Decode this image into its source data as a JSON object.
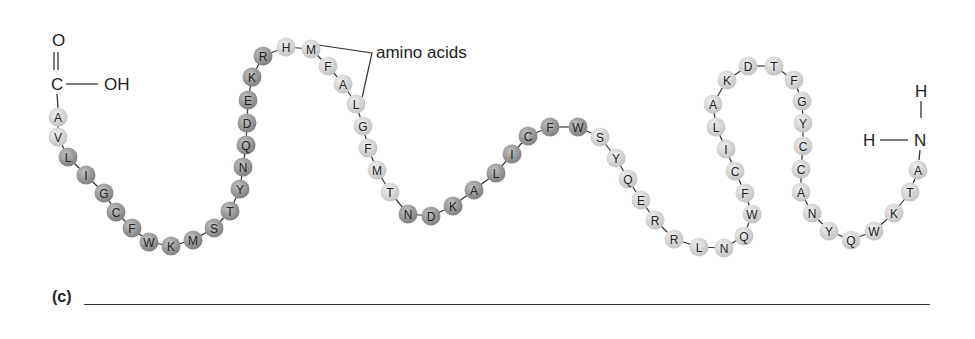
{
  "carboxyl_group": {
    "O": "O",
    "C": "C",
    "OH": "OH",
    "name": "carboxyl-terminus"
  },
  "amino_group": {
    "H_top": "H",
    "H_left": "H",
    "N": "N",
    "name": "amino-terminus"
  },
  "callout": {
    "label": "amino acids"
  },
  "question": {
    "label": "(c)",
    "answer_line": ""
  },
  "colors": {
    "light_residue": "#d6d6d6",
    "dark_residue": "#9a9a9a",
    "bond": "#333333"
  },
  "residues": [
    {
      "aa": "A",
      "x": 58,
      "y": 117,
      "shade": "light"
    },
    {
      "aa": "V",
      "x": 58,
      "y": 137,
      "shade": "light"
    },
    {
      "aa": "L",
      "x": 68,
      "y": 157,
      "shade": "dark"
    },
    {
      "aa": "I",
      "x": 86,
      "y": 175,
      "shade": "dark"
    },
    {
      "aa": "G",
      "x": 104,
      "y": 193,
      "shade": "dark"
    },
    {
      "aa": "C",
      "x": 116,
      "y": 212,
      "shade": "dark"
    },
    {
      "aa": "F",
      "x": 132,
      "y": 228,
      "shade": "dark"
    },
    {
      "aa": "W",
      "x": 149,
      "y": 242,
      "shade": "dark"
    },
    {
      "aa": "K",
      "x": 171,
      "y": 246,
      "shade": "dark"
    },
    {
      "aa": "M",
      "x": 193,
      "y": 240,
      "shade": "dark"
    },
    {
      "aa": "S",
      "x": 214,
      "y": 228,
      "shade": "dark"
    },
    {
      "aa": "T",
      "x": 230,
      "y": 211,
      "shade": "dark"
    },
    {
      "aa": "Y",
      "x": 240,
      "y": 189,
      "shade": "dark"
    },
    {
      "aa": "N",
      "x": 243,
      "y": 167,
      "shade": "dark"
    },
    {
      "aa": "Q",
      "x": 246,
      "y": 145,
      "shade": "dark"
    },
    {
      "aa": "D",
      "x": 247,
      "y": 123,
      "shade": "dark"
    },
    {
      "aa": "E",
      "x": 248,
      "y": 100,
      "shade": "dark"
    },
    {
      "aa": "K",
      "x": 252,
      "y": 77,
      "shade": "dark"
    },
    {
      "aa": "R",
      "x": 263,
      "y": 56,
      "shade": "dark"
    },
    {
      "aa": "H",
      "x": 286,
      "y": 47,
      "shade": "light"
    },
    {
      "aa": "M",
      "x": 311,
      "y": 49,
      "shade": "light"
    },
    {
      "aa": "F",
      "x": 328,
      "y": 66,
      "shade": "light"
    },
    {
      "aa": "A",
      "x": 343,
      "y": 84,
      "shade": "light"
    },
    {
      "aa": "L",
      "x": 356,
      "y": 104,
      "shade": "light"
    },
    {
      "aa": "G",
      "x": 363,
      "y": 126,
      "shade": "light"
    },
    {
      "aa": "F",
      "x": 368,
      "y": 148,
      "shade": "light"
    },
    {
      "aa": "M",
      "x": 377,
      "y": 170,
      "shade": "light"
    },
    {
      "aa": "T",
      "x": 390,
      "y": 192,
      "shade": "light"
    },
    {
      "aa": "N",
      "x": 408,
      "y": 214,
      "shade": "dark"
    },
    {
      "aa": "D",
      "x": 431,
      "y": 216,
      "shade": "dark"
    },
    {
      "aa": "K",
      "x": 453,
      "y": 206,
      "shade": "dark"
    },
    {
      "aa": "A",
      "x": 474,
      "y": 190,
      "shade": "dark"
    },
    {
      "aa": "L",
      "x": 496,
      "y": 173,
      "shade": "dark"
    },
    {
      "aa": "I",
      "x": 512,
      "y": 154,
      "shade": "dark"
    },
    {
      "aa": "C",
      "x": 528,
      "y": 136,
      "shade": "dark"
    },
    {
      "aa": "F",
      "x": 550,
      "y": 127,
      "shade": "dark"
    },
    {
      "aa": "W",
      "x": 578,
      "y": 127,
      "shade": "dark"
    },
    {
      "aa": "S",
      "x": 600,
      "y": 137,
      "shade": "light"
    },
    {
      "aa": "Y",
      "x": 616,
      "y": 158,
      "shade": "light"
    },
    {
      "aa": "Q",
      "x": 628,
      "y": 179,
      "shade": "light"
    },
    {
      "aa": "E",
      "x": 641,
      "y": 200,
      "shade": "light"
    },
    {
      "aa": "R",
      "x": 655,
      "y": 220,
      "shade": "light"
    },
    {
      "aa": "R",
      "x": 674,
      "y": 239,
      "shade": "light"
    },
    {
      "aa": "L",
      "x": 699,
      "y": 247,
      "shade": "light"
    },
    {
      "aa": "N",
      "x": 724,
      "y": 248,
      "shade": "light"
    },
    {
      "aa": "Q",
      "x": 744,
      "y": 236,
      "shade": "light"
    },
    {
      "aa": "W",
      "x": 752,
      "y": 214,
      "shade": "light"
    },
    {
      "aa": "F",
      "x": 745,
      "y": 193,
      "shade": "light"
    },
    {
      "aa": "C",
      "x": 735,
      "y": 171,
      "shade": "light"
    },
    {
      "aa": "I",
      "x": 726,
      "y": 149,
      "shade": "light"
    },
    {
      "aa": "L",
      "x": 716,
      "y": 127,
      "shade": "light"
    },
    {
      "aa": "A",
      "x": 713,
      "y": 104,
      "shade": "light"
    },
    {
      "aa": "K",
      "x": 727,
      "y": 80,
      "shade": "light"
    },
    {
      "aa": "D",
      "x": 748,
      "y": 66,
      "shade": "light"
    },
    {
      "aa": "T",
      "x": 774,
      "y": 66,
      "shade": "light"
    },
    {
      "aa": "F",
      "x": 794,
      "y": 80,
      "shade": "light"
    },
    {
      "aa": "G",
      "x": 802,
      "y": 101,
      "shade": "light"
    },
    {
      "aa": "Y",
      "x": 803,
      "y": 123,
      "shade": "light"
    },
    {
      "aa": "C",
      "x": 803,
      "y": 146,
      "shade": "light"
    },
    {
      "aa": "C",
      "x": 801,
      "y": 169,
      "shade": "light"
    },
    {
      "aa": "A",
      "x": 801,
      "y": 192,
      "shade": "light"
    },
    {
      "aa": "N",
      "x": 812,
      "y": 213,
      "shade": "light"
    },
    {
      "aa": "Y",
      "x": 829,
      "y": 231,
      "shade": "light"
    },
    {
      "aa": "Q",
      "x": 851,
      "y": 240,
      "shade": "light"
    },
    {
      "aa": "W",
      "x": 874,
      "y": 231,
      "shade": "light"
    },
    {
      "aa": "K",
      "x": 894,
      "y": 213,
      "shade": "light"
    },
    {
      "aa": "T",
      "x": 910,
      "y": 192,
      "shade": "light"
    },
    {
      "aa": "A",
      "x": 918,
      "y": 170,
      "shade": "light"
    }
  ]
}
